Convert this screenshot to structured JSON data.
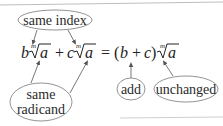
{
  "diagram": {
    "callouts": {
      "same_index": "same index",
      "same_radicand_line1": "same",
      "same_radicand_line2": "radicand",
      "add": "add",
      "unchanged": "unchanged"
    },
    "equation": {
      "coef1": "b",
      "coef2": "c",
      "index": "m",
      "radicand": "a",
      "plus": "+",
      "equals": "=",
      "open_paren": "(",
      "close_paren": ")",
      "radical": "√"
    }
  }
}
